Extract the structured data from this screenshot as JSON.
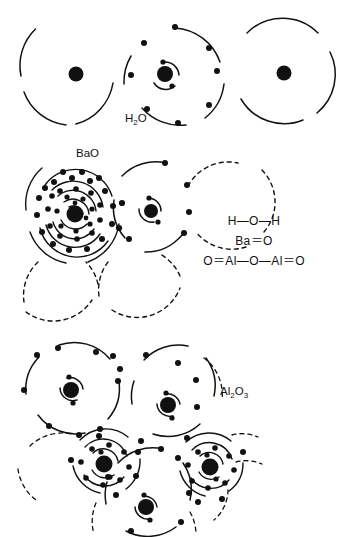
{
  "figure": {
    "title_visible": false,
    "background_color": "#ffffff",
    "ink_color": "#111111",
    "panels": [
      {
        "id": "h2o-panel",
        "label": "H₂O",
        "label_text": "H",
        "label_sub": "2",
        "label_tail": "O",
        "atoms": [
          {
            "name": "hydrogen-left",
            "symbol": "H",
            "shells": [
              1
            ],
            "nucleus": "large"
          },
          {
            "name": "oxygen-center",
            "symbol": "O",
            "shells": [
              2,
              6
            ],
            "nucleus": "large"
          },
          {
            "name": "hydrogen-right",
            "symbol": "H",
            "shells": [
              1
            ],
            "nucleus": "large"
          }
        ]
      },
      {
        "id": "bao-panel",
        "label": "BaO",
        "atoms": [
          {
            "name": "barium",
            "symbol": "Ba",
            "shells": [
              2,
              8,
              18,
              18,
              8,
              2
            ],
            "nucleus": "large"
          },
          {
            "name": "oxygen",
            "symbol": "O",
            "shells": [
              2,
              6
            ],
            "nucleus": "large"
          }
        ]
      },
      {
        "id": "al2o3-panel",
        "label": "Al₂O₃",
        "label_text": "Al",
        "label_sub": "2",
        "label_mid": "O",
        "label_sub2": "3",
        "atoms": [
          {
            "name": "oxygen-upper-left",
            "symbol": "O",
            "shells": [
              2,
              6
            ],
            "nucleus": "large"
          },
          {
            "name": "oxygen-upper-right",
            "symbol": "O",
            "shells": [
              2,
              6
            ],
            "nucleus": "large"
          },
          {
            "name": "aluminium-left",
            "symbol": "Al",
            "shells": [
              2,
              8,
              3
            ],
            "nucleus": "large"
          },
          {
            "name": "aluminium-right",
            "symbol": "Al",
            "shells": [
              2,
              8,
              3
            ],
            "nucleus": "large"
          },
          {
            "name": "oxygen-lower",
            "symbol": "O",
            "shells": [
              2,
              6
            ],
            "nucleus": "large"
          }
        ]
      }
    ],
    "formulas": [
      {
        "name": "water-formula",
        "text": "H—O—H"
      },
      {
        "name": "barium-oxide-formula",
        "text": "Ba＝O"
      },
      {
        "name": "aluminium-oxide-formula",
        "text": "O＝Al—O—Al＝O"
      }
    ],
    "legend_note": ""
  }
}
